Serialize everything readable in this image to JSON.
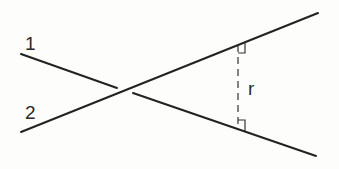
{
  "diagram": {
    "title": "",
    "labels": {
      "line1": "1",
      "line2": "2",
      "distance": "r"
    },
    "lines": [
      {
        "id": "line1",
        "segments": [
          [
            21,
            54,
            117,
            88
          ],
          [
            133,
            93,
            316,
            156
          ]
        ],
        "note": "passes behind line 2 (gap at crossing)"
      },
      {
        "id": "line2",
        "segments": [
          [
            21,
            132,
            318,
            13
          ]
        ]
      }
    ],
    "perpendicular": {
      "x": 238,
      "y_top": 44,
      "y_bottom": 128,
      "style": "dashed",
      "right_angle_marks": 2
    },
    "colors": {
      "stroke": "#222222",
      "background": "#fdfdfb"
    }
  }
}
